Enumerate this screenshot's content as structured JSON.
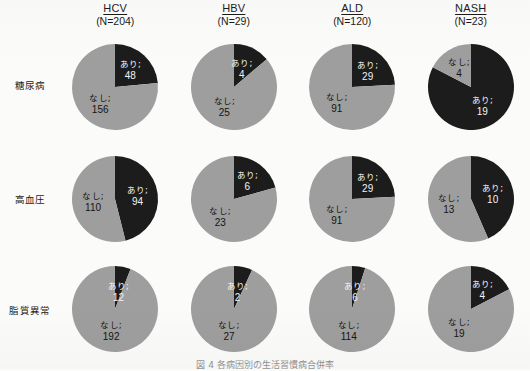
{
  "figure": {
    "row_label_header": "",
    "caption": "図 4 各病因別の生活習慣病合併率",
    "colors": {
      "yes_slice": "#1c1c1c",
      "no_slice": "#9e9e9e",
      "background": "#fbfbfa",
      "text": "#1b1b1b",
      "text_on_dark": "#f2f2f2"
    },
    "legend": {
      "yes_label": "あり",
      "no_label": "なし"
    }
  },
  "columns": [
    {
      "group": "HCV",
      "n_text": "(N=204)",
      "n": 204
    },
    {
      "group": "HBV",
      "n_text": "(N=29)",
      "n": 29
    },
    {
      "group": "ALD",
      "n_text": "(N=120)",
      "n": 120
    },
    {
      "group": "NASH",
      "n_text": "(N=23)",
      "n": 23
    }
  ],
  "rows": [
    {
      "label": "糖尿病"
    },
    {
      "label": "高血圧"
    },
    {
      "label": "脂質異常"
    }
  ],
  "chart_data": {
    "type": "pie",
    "title": "各病因別の生活習慣病合併率",
    "categories": [
      "あり",
      "なし"
    ],
    "legend_position": "in-slice",
    "grid": false,
    "rows": [
      "糖尿病",
      "高血圧",
      "脂質異常"
    ],
    "columns": [
      "HCV",
      "HBV",
      "ALD",
      "NASH"
    ],
    "column_totals": [
      204,
      29,
      120,
      23
    ],
    "pies": [
      {
        "row": "糖尿病",
        "column": "HCV",
        "total": 204,
        "slices": [
          {
            "name": "あり",
            "value": 48,
            "label_name": "あり;",
            "label_value": "48",
            "percent": 23.5,
            "color": "#1c1c1c",
            "text_on": "dark"
          },
          {
            "name": "なし",
            "value": 156,
            "label_name": "なし;",
            "label_value": "156",
            "percent": 76.5,
            "color": "#9e9e9e",
            "text_on": "light"
          }
        ]
      },
      {
        "row": "糖尿病",
        "column": "HBV",
        "total": 29,
        "slices": [
          {
            "name": "あり",
            "value": 4,
            "label_name": "あり;",
            "label_value": "4",
            "percent": 13.8,
            "color": "#1c1c1c",
            "text_on": "dark"
          },
          {
            "name": "なし",
            "value": 25,
            "label_name": "なし;",
            "label_value": "25",
            "percent": 86.2,
            "color": "#9e9e9e",
            "text_on": "light"
          }
        ]
      },
      {
        "row": "糖尿病",
        "column": "ALD",
        "total": 120,
        "slices": [
          {
            "name": "あり",
            "value": 29,
            "label_name": "あり;",
            "label_value": "29",
            "percent": 24.2,
            "color": "#1c1c1c",
            "text_on": "dark"
          },
          {
            "name": "なし",
            "value": 91,
            "label_name": "なし;",
            "label_value": "91",
            "percent": 75.8,
            "color": "#9e9e9e",
            "text_on": "light"
          }
        ]
      },
      {
        "row": "糖尿病",
        "column": "NASH",
        "total": 23,
        "slices": [
          {
            "name": "あり",
            "value": 19,
            "label_name": "あり;",
            "label_value": "19",
            "percent": 82.6,
            "color": "#1c1c1c",
            "text_on": "dark"
          },
          {
            "name": "なし",
            "value": 4,
            "label_name": "なし;",
            "label_value": "4",
            "percent": 17.4,
            "color": "#9e9e9e",
            "text_on": "light"
          }
        ]
      },
      {
        "row": "高血圧",
        "column": "HCV",
        "total": 204,
        "slices": [
          {
            "name": "あり",
            "value": 94,
            "label_name": "あり;",
            "label_value": "94",
            "percent": 46.1,
            "color": "#1c1c1c",
            "text_on": "dark"
          },
          {
            "name": "なし",
            "value": 110,
            "label_name": "なし;",
            "label_value": "110",
            "percent": 53.9,
            "color": "#9e9e9e",
            "text_on": "light"
          }
        ]
      },
      {
        "row": "高血圧",
        "column": "HBV",
        "total": 29,
        "slices": [
          {
            "name": "あり",
            "value": 6,
            "label_name": "あり;",
            "label_value": "6",
            "percent": 20.7,
            "color": "#1c1c1c",
            "text_on": "dark"
          },
          {
            "name": "なし",
            "value": 23,
            "label_name": "なし;",
            "label_value": "23",
            "percent": 79.3,
            "color": "#9e9e9e",
            "text_on": "light"
          }
        ]
      },
      {
        "row": "高血圧",
        "column": "ALD",
        "total": 120,
        "slices": [
          {
            "name": "あり",
            "value": 29,
            "label_name": "あり;",
            "label_value": "29",
            "percent": 24.2,
            "color": "#1c1c1c",
            "text_on": "dark"
          },
          {
            "name": "なし",
            "value": 91,
            "label_name": "なし;",
            "label_value": "91",
            "percent": 75.8,
            "color": "#9e9e9e",
            "text_on": "light"
          }
        ]
      },
      {
        "row": "高血圧",
        "column": "NASH",
        "total": 23,
        "slices": [
          {
            "name": "あり",
            "value": 10,
            "label_name": "あり;",
            "label_value": "10",
            "percent": 43.5,
            "color": "#1c1c1c",
            "text_on": "dark"
          },
          {
            "name": "なし",
            "value": 13,
            "label_name": "なし;",
            "label_value": "13",
            "percent": 56.5,
            "color": "#9e9e9e",
            "text_on": "light"
          }
        ]
      },
      {
        "row": "脂質異常",
        "column": "HCV",
        "total": 204,
        "slices": [
          {
            "name": "あり",
            "value": 12,
            "label_name": "あり;",
            "label_value": "12",
            "percent": 5.9,
            "color": "#1c1c1c",
            "text_on": "dark"
          },
          {
            "name": "なし",
            "value": 192,
            "label_name": "なし;",
            "label_value": "192",
            "percent": 94.1,
            "color": "#9e9e9e",
            "text_on": "light"
          }
        ]
      },
      {
        "row": "脂質異常",
        "column": "HBV",
        "total": 29,
        "slices": [
          {
            "name": "あり",
            "value": 2,
            "label_name": "あり;",
            "label_value": "2",
            "percent": 6.9,
            "color": "#1c1c1c",
            "text_on": "dark"
          },
          {
            "name": "なし",
            "value": 27,
            "label_name": "なし;",
            "label_value": "27",
            "percent": 93.1,
            "color": "#9e9e9e",
            "text_on": "light"
          }
        ]
      },
      {
        "row": "脂質異常",
        "column": "ALD",
        "total": 120,
        "slices": [
          {
            "name": "あり",
            "value": 6,
            "label_name": "あり;",
            "label_value": "6",
            "percent": 5.0,
            "color": "#1c1c1c",
            "text_on": "dark"
          },
          {
            "name": "なし",
            "value": 114,
            "label_name": "なし;",
            "label_value": "114",
            "percent": 95.0,
            "color": "#9e9e9e",
            "text_on": "light"
          }
        ]
      },
      {
        "row": "脂質異常",
        "column": "NASH",
        "total": 23,
        "slices": [
          {
            "name": "あり",
            "value": 4,
            "label_name": "あり;",
            "label_value": "4",
            "percent": 17.4,
            "color": "#1c1c1c",
            "text_on": "dark"
          },
          {
            "name": "なし",
            "value": 19,
            "label_name": "なし;",
            "label_value": "19",
            "percent": 82.6,
            "color": "#9e9e9e",
            "text_on": "light"
          }
        ]
      }
    ]
  }
}
